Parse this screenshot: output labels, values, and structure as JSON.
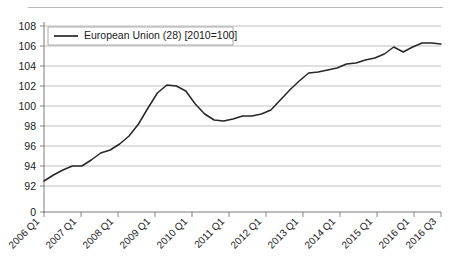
{
  "chart_data": {
    "type": "line",
    "title": "",
    "subtitle": "",
    "xlabel": "",
    "ylabel": "",
    "legend_position": "top-left",
    "grid": true,
    "ylim": [
      92,
      108
    ],
    "yticks": [
      "0",
      "92",
      "94",
      "96",
      "98",
      "100",
      "102",
      "104",
      "106",
      "108"
    ],
    "y_axis_break_label": "0",
    "xticks": [
      "2006 Q1",
      "2007 Q1",
      "2008 Q1",
      "2009 Q1",
      "2010 Q1",
      "2011 Q1",
      "2012 Q1",
      "2013 Q1",
      "2014 Q1",
      "2015 Q1",
      "2016 Q1",
      "2016 Q3"
    ],
    "series": [
      {
        "name": "European Union (28) [2010=100]",
        "color": "#262626",
        "x": [
          "2006 Q1",
          "2006 Q2",
          "2006 Q3",
          "2006 Q4",
          "2007 Q1",
          "2007 Q2",
          "2007 Q3",
          "2007 Q4",
          "2008 Q1",
          "2008 Q2",
          "2008 Q3",
          "2008 Q4",
          "2009 Q1",
          "2009 Q2",
          "2009 Q3",
          "2009 Q4",
          "2010 Q1",
          "2010 Q2",
          "2010 Q3",
          "2010 Q4",
          "2011 Q1",
          "2011 Q2",
          "2011 Q3",
          "2011 Q4",
          "2012 Q1",
          "2012 Q2",
          "2012 Q3",
          "2012 Q4",
          "2013 Q1",
          "2013 Q2",
          "2013 Q3",
          "2013 Q4",
          "2014 Q1",
          "2014 Q2",
          "2014 Q3",
          "2014 Q4",
          "2015 Q1",
          "2015 Q2",
          "2015 Q3",
          "2015 Q4",
          "2016 Q1",
          "2016 Q2",
          "2016 Q3"
        ],
        "values": [
          92.5,
          93.1,
          93.6,
          94.0,
          94.0,
          94.6,
          95.3,
          95.6,
          96.2,
          97.0,
          98.2,
          99.8,
          101.3,
          102.1,
          102.0,
          101.5,
          100.2,
          99.2,
          98.6,
          98.5,
          98.7,
          99.0,
          99.0,
          99.2,
          99.6,
          100.6,
          101.6,
          102.5,
          103.3,
          103.4,
          103.6,
          103.8,
          104.2,
          104.3,
          104.6,
          104.8,
          105.2,
          105.9,
          105.4,
          105.9,
          106.3,
          106.3,
          106.2
        ]
      }
    ]
  },
  "legend": {
    "entry_label": "European Union (28) [2010=100]"
  }
}
